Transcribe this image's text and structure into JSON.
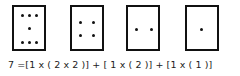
{
  "diagram": {
    "boxes": [
      {
        "label": "box-seven-dots",
        "dots": 7,
        "left": 12,
        "top": 5,
        "width": 34,
        "height": 46,
        "dot_positions": [
          [
            22,
            15
          ],
          [
            29,
            15
          ],
          [
            36,
            15
          ],
          [
            29,
            28
          ],
          [
            22,
            42
          ],
          [
            29,
            42
          ],
          [
            36,
            42
          ]
        ]
      },
      {
        "label": "box-four-dots",
        "dots": 4,
        "left": 70,
        "top": 5,
        "width": 34,
        "height": 46,
        "dot_positions": [
          [
            80,
            22
          ],
          [
            93,
            22
          ],
          [
            80,
            35
          ],
          [
            93,
            35
          ]
        ]
      },
      {
        "label": "box-two-dots",
        "dots": 2,
        "left": 126,
        "top": 5,
        "width": 34,
        "height": 46,
        "dot_positions": [
          [
            136,
            29
          ],
          [
            151,
            29
          ]
        ]
      },
      {
        "label": "box-one-dot",
        "dots": 1,
        "left": 185,
        "top": 5,
        "width": 34,
        "height": 46,
        "dot_positions": [
          [
            201,
            29
          ]
        ]
      }
    ],
    "equation": "7 =[1 x ( 2 x 2 )] + [ 1 x ( 2 )] + [1 x ( 1 )]"
  }
}
